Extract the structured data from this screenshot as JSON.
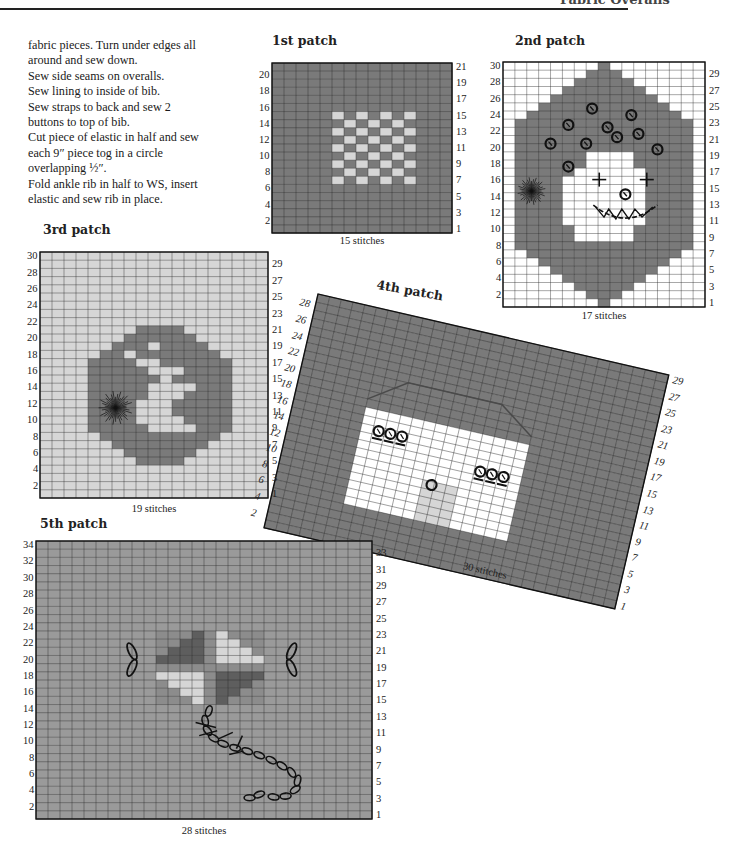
{
  "page": {
    "running_head": "Fabric Overalls"
  },
  "instructions": {
    "lines": [
      "fabric pieces. Turn under edges all",
      "around and sew down.",
      "Sew side seams on overalls.",
      "Sew lining to inside of bib.",
      "Sew straps to back and sew 2",
      "buttons to top of bib.",
      "Cut piece of elastic in half and sew",
      "each 9″ piece tog in a circle",
      "overlapping ½″.",
      "Fold ankle rib in half to WS, insert",
      "elastic and sew rib in place."
    ]
  },
  "colors": {
    "dark": "#7a7a7a",
    "mid": "#9a9a9a",
    "light": "#d6d6d6",
    "white": "#ffffff",
    "verydark": "#5e5e5e",
    "gridline": "#2a2a2a"
  },
  "patches": [
    {
      "id": "patch1",
      "title": "1st patch",
      "caption": "15 stitches",
      "stitches": 15,
      "rows": 21,
      "left_labels": [
        "20",
        "18",
        "16",
        "14",
        "12",
        "10",
        "8",
        "6",
        "4",
        "2"
      ],
      "right_labels": [
        "21",
        "19",
        "17",
        "15",
        "13",
        "11",
        "9",
        "7",
        "5",
        "3",
        "1"
      ],
      "background": "dark",
      "motif": "checkerboard",
      "motif_region": {
        "col_start": 5,
        "col_end": 11,
        "row_start": 7,
        "row_end": 15
      }
    },
    {
      "id": "patch2",
      "title": "2nd patch",
      "caption": "17 stitches",
      "stitches": 17,
      "rows": 30,
      "left_labels": [
        "30",
        "28",
        "26",
        "24",
        "22",
        "20",
        "18",
        "16",
        "14",
        "12",
        "10",
        "8",
        "6",
        "4",
        "2"
      ],
      "right_labels": [
        "29",
        "27",
        "25",
        "23",
        "21",
        "19",
        "17",
        "15",
        "13",
        "11",
        "9",
        "7",
        "5",
        "3",
        "1"
      ],
      "background": "white",
      "motif": "clown face with curly hair, pompom, cross-stitch eyes and toothy grin",
      "embroidery": [
        "french-knot hair curls",
        "pompom",
        "cross-stitch eyes",
        "french-knot nose",
        "back-stitch mouth"
      ]
    },
    {
      "id": "patch3",
      "title": "3rd patch",
      "caption": "19 stitches",
      "stitches": 19,
      "rows": 30,
      "left_labels": [
        "30",
        "28",
        "26",
        "24",
        "22",
        "20",
        "18",
        "16",
        "14",
        "12",
        "10",
        "8",
        "6",
        "4",
        "2"
      ],
      "right_labels": [
        "29",
        "27",
        "25",
        "23",
        "21",
        "19",
        "17",
        "15",
        "13",
        "11",
        "9",
        "7",
        "5",
        "3",
        "1"
      ],
      "background": "light",
      "motif": "rabbit in round medallion with pompom tail"
    },
    {
      "id": "patch4",
      "title": "4th patch",
      "caption": "30 stitches",
      "stitches": 30,
      "rows": 29,
      "left_labels": [
        "28",
        "26",
        "24",
        "22",
        "20",
        "18",
        "16",
        "14",
        "12",
        "10",
        "8",
        "6",
        "4",
        "2"
      ],
      "right_labels": [
        "29",
        "27",
        "25",
        "23",
        "21",
        "19",
        "17",
        "15",
        "13",
        "11",
        "9",
        "7",
        "5",
        "3",
        "1"
      ],
      "background": "dark",
      "rotation_deg": 13,
      "motif": "window with two sets of three buttons and one button below"
    },
    {
      "id": "patch5",
      "title": "5th patch",
      "caption": "28 stitches",
      "stitches": 28,
      "rows": 34,
      "left_labels": [
        "34",
        "32",
        "30",
        "28",
        "26",
        "24",
        "22",
        "20",
        "18",
        "16",
        "14",
        "12",
        "10",
        "8",
        "6",
        "4",
        "2"
      ],
      "right_labels": [
        "33",
        "31",
        "29",
        "27",
        "25",
        "23",
        "21",
        "19",
        "17",
        "15",
        "13",
        "11",
        "9",
        "7",
        "5",
        "3",
        "1"
      ],
      "background": "mid",
      "motif": "kite with chain-stitch tail and lazy-daisy bows"
    }
  ]
}
